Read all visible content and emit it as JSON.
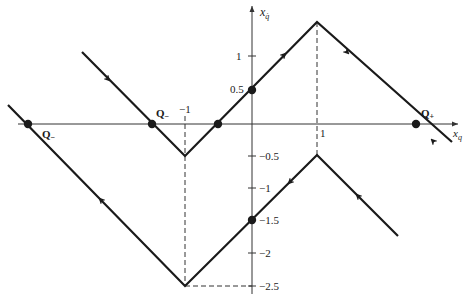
{
  "diagram": {
    "type": "phase-portrait",
    "axes": {
      "x_label": "x",
      "x_label_sub": "q",
      "y_label": "x",
      "y_label_sub": "q̇",
      "x_ticks": [
        {
          "value": -1,
          "label": "−1"
        },
        {
          "value": 1,
          "label": "1"
        }
      ],
      "y_ticks": [
        {
          "value": 1,
          "label": "1"
        },
        {
          "value": 0.5,
          "label": "0.5"
        },
        {
          "value": -0.5,
          "label": "−0.5"
        },
        {
          "value": -1,
          "label": "−1"
        },
        {
          "value": -1.5,
          "label": "−1.5"
        },
        {
          "value": -2,
          "label": "−2"
        },
        {
          "value": -2.5,
          "label": "−2.5"
        }
      ]
    },
    "points": [
      {
        "name": "Q-left-outer",
        "label": "Q",
        "sub": "−",
        "x": -3.4,
        "y": 0
      },
      {
        "name": "Q-left-inner",
        "label": "Q",
        "sub": "−",
        "x": -1.5,
        "y": 0
      },
      {
        "name": "Q-plus",
        "label": "Q",
        "sub": "+",
        "x": 2.5,
        "y": 0
      },
      {
        "name": "crossing-x",
        "x": -0.5,
        "y": 0
      },
      {
        "name": "crossing-y-upper",
        "x": 0,
        "y": 0.5
      },
      {
        "name": "crossing-y-lower",
        "x": 0,
        "y": -1.5
      }
    ],
    "trajectories": [
      {
        "name": "upper-trajectory",
        "vertices": [
          [
            -2.6,
            1.1
          ],
          [
            -1,
            -0.5
          ],
          [
            1,
            1.5
          ],
          [
            3.05,
            -0.3
          ]
        ]
      },
      {
        "name": "lower-trajectory",
        "vertices": [
          [
            -3.7,
            0.3
          ],
          [
            -1,
            -2.5
          ],
          [
            1,
            -0.5
          ],
          [
            2.2,
            -1.7
          ]
        ]
      }
    ],
    "guides": [
      {
        "name": "dashed-x-minus1",
        "from": [
          -1,
          0
        ],
        "to": [
          -1,
          -2.5
        ]
      },
      {
        "name": "dashed-x-1",
        "from": [
          1,
          1.5
        ],
        "to": [
          1,
          -0.5
        ]
      },
      {
        "name": "dashed-y-minus2.5",
        "from": [
          -1,
          -2.5
        ],
        "to": [
          0,
          -2.5
        ]
      }
    ]
  }
}
